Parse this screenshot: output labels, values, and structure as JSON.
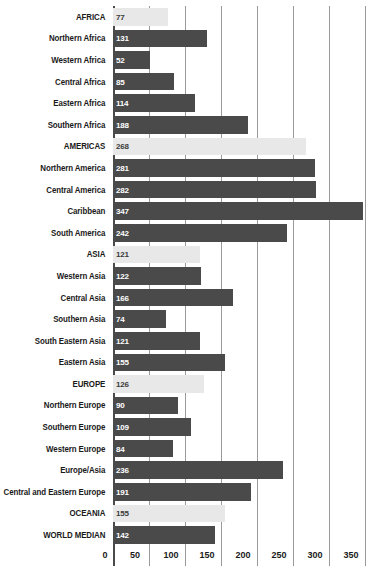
{
  "chart_data": {
    "type": "bar",
    "orientation": "horizontal",
    "title": "",
    "subtitle": "",
    "xlabel": "",
    "ylabel": "",
    "xlim": [
      0,
      350
    ],
    "xticks": [
      0,
      50,
      100,
      150,
      200,
      250,
      300,
      350
    ],
    "grid": true,
    "legend": null,
    "series_name": "value",
    "categories": [
      "AFRICA",
      "Northern Africa",
      "Western Africa",
      "Central Africa",
      "Eastern Africa",
      "Southern Africa",
      "AMERICAS",
      "Northern America",
      "Central America",
      "Caribbean",
      "South America",
      "ASIA",
      "Western Asia",
      "Central Asia",
      "Southern Asia",
      "South Eastern Asia",
      "Eastern Asia",
      "EUROPE",
      "Northern Europe",
      "Southern Europe",
      "Western Europe",
      "Europe/Asia",
      "Central and Eastern Europe",
      "OCEANIA",
      "WORLD MEDIAN"
    ],
    "values": [
      77,
      131,
      52,
      85,
      114,
      188,
      268,
      281,
      282,
      347,
      242,
      121,
      122,
      166,
      74,
      121,
      155,
      126,
      90,
      109,
      84,
      236,
      191,
      155,
      142
    ],
    "bar_styles": [
      "light",
      "dark",
      "dark",
      "dark",
      "dark",
      "dark",
      "light",
      "dark",
      "dark",
      "dark",
      "dark",
      "light",
      "dark",
      "dark",
      "dark",
      "dark",
      "dark",
      "light",
      "dark",
      "dark",
      "dark",
      "dark",
      "dark",
      "light",
      "dark"
    ]
  },
  "colors": {
    "bar_dark": "#4a4a4a",
    "bar_light": "#e8e8e8",
    "gridline": "#9a9a9a",
    "axis": "#4a4a4a",
    "background": "#ffffff",
    "label_text": "#1a1a1a",
    "value_on_dark": "#ffffff",
    "value_on_light": "#3a3a3a"
  }
}
